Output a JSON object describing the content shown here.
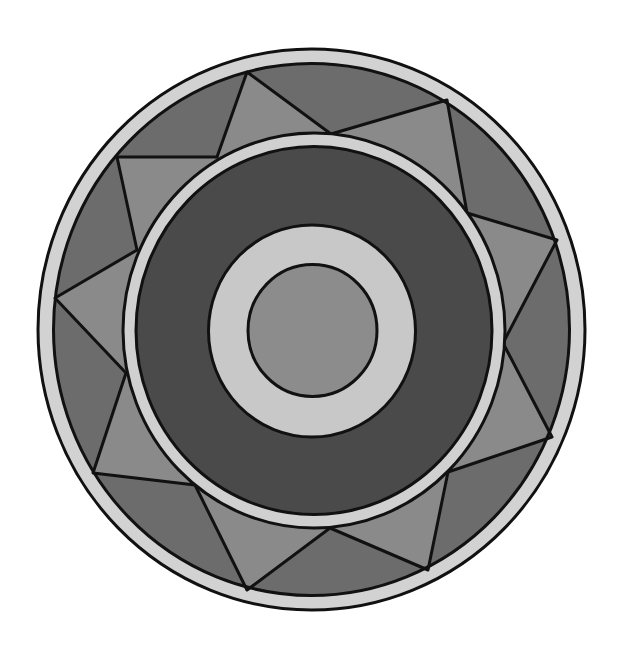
{
  "figure": {
    "title": "Concentric circular mandala with zigzag star band",
    "width": 627,
    "height": 657,
    "background": "#ffffff",
    "stroke_color": "#111111",
    "stroke_width": 3,
    "colors": {
      "outer_rim": "#d2d2d2",
      "band_dark": "#6c6c6c",
      "band_light": "#8a8a8a",
      "inner_rim": "#d0d0d0",
      "dark_ring": "#4a4a4a",
      "center_ring": "#c8c8c8",
      "center_disc": "#8c8c8c"
    },
    "ellipses": {
      "outer_edge": {
        "cx": 311.5,
        "cy": 329.5,
        "rx": 273.5,
        "ry": 280.5
      },
      "outer_rim_inner": {
        "cx": 311.5,
        "cy": 329.5,
        "rx": 258,
        "ry": 266
      },
      "inner_rim_outer": {
        "cx": 314,
        "cy": 330.5,
        "rx": 191,
        "ry": 197.5
      },
      "inner_rim_inner": {
        "cx": 314,
        "cy": 330.5,
        "rx": 178,
        "ry": 184
      },
      "center_ring_outer": {
        "cx": 312,
        "cy": 331,
        "rx": 103.5,
        "ry": 106
      },
      "center_disc": {
        "cx": 312.5,
        "cy": 330.5,
        "rx": 64.5,
        "ry": 66
      }
    },
    "zigzag_vertices": [
      {
        "ring": "inner",
        "x": 331,
        "y": 134
      },
      {
        "ring": "outer",
        "x": 447,
        "y": 100
      },
      {
        "ring": "inner",
        "x": 467,
        "y": 213
      },
      {
        "ring": "outer",
        "x": 557,
        "y": 240
      },
      {
        "ring": "inner",
        "x": 503,
        "y": 343
      },
      {
        "ring": "outer",
        "x": 552,
        "y": 437
      },
      {
        "ring": "inner",
        "x": 448,
        "y": 472
      },
      {
        "ring": "outer",
        "x": 428,
        "y": 570
      },
      {
        "ring": "inner",
        "x": 330,
        "y": 528
      },
      {
        "ring": "outer",
        "x": 247,
        "y": 590
      },
      {
        "ring": "inner",
        "x": 195,
        "y": 485
      },
      {
        "ring": "outer",
        "x": 93,
        "y": 473
      },
      {
        "ring": "inner",
        "x": 126,
        "y": 373
      },
      {
        "ring": "outer",
        "x": 55,
        "y": 298
      },
      {
        "ring": "inner",
        "x": 137,
        "y": 250
      },
      {
        "ring": "outer",
        "x": 117,
        "y": 157
      },
      {
        "ring": "inner",
        "x": 217,
        "y": 157
      },
      {
        "ring": "outer",
        "x": 247,
        "y": 72
      }
    ]
  }
}
